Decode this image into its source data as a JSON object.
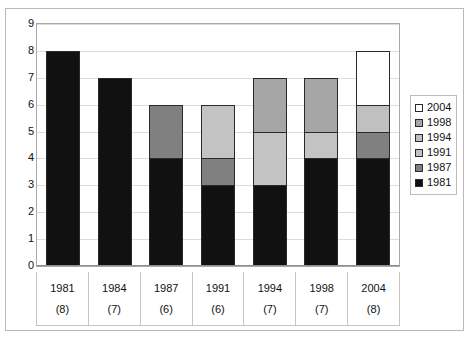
{
  "chart_data": {
    "type": "bar",
    "subtype": "stacked-bar",
    "title": "",
    "xlabel": "",
    "ylabel": "",
    "ylim": [
      0,
      9
    ],
    "ytick_labels": [
      "9",
      "8",
      "7",
      "6",
      "5",
      "4",
      "3",
      "2",
      "1",
      "0"
    ],
    "yticks": [
      9,
      8,
      7,
      6,
      5,
      4,
      3,
      2,
      1,
      0
    ],
    "grid": true,
    "legend_position": "right",
    "categories": [
      "1981",
      "1984",
      "1987",
      "1991",
      "1994",
      "1998",
      "2004"
    ],
    "category_counts": [
      "(8)",
      "(7)",
      "(6)",
      "(6)",
      "(7)",
      "(7)",
      "(8)"
    ],
    "totals": [
      8,
      7,
      6,
      6,
      7,
      7,
      8
    ],
    "series": [
      {
        "name": "1981",
        "color": "#111111",
        "values": [
          8,
          7,
          4,
          3,
          3,
          4,
          4
        ]
      },
      {
        "name": "1987",
        "color": "#808080",
        "values": [
          0,
          0,
          2,
          1,
          0,
          0,
          1
        ]
      },
      {
        "name": "1991",
        "color": "#c3c3c3",
        "values": [
          0,
          0,
          0,
          2,
          2,
          1,
          0
        ]
      },
      {
        "name": "1994",
        "color": "#c0c0c0",
        "values": [
          0,
          0,
          0,
          0,
          0,
          0,
          1
        ]
      },
      {
        "name": "1998",
        "color": "#a6a6a6",
        "values": [
          0,
          0,
          0,
          0,
          2,
          2,
          0
        ]
      },
      {
        "name": "2004",
        "color": "#ffffff",
        "values": [
          0,
          0,
          0,
          0,
          0,
          0,
          2
        ]
      }
    ],
    "legend": [
      {
        "label": "2004",
        "color": "#ffffff"
      },
      {
        "label": "1998",
        "color": "#a6a6a6"
      },
      {
        "label": "1994",
        "color": "#c0c0c0"
      },
      {
        "label": "1991",
        "color": "#c3c3c3"
      },
      {
        "label": "1987",
        "color": "#808080"
      },
      {
        "label": "1981",
        "color": "#111111"
      }
    ],
    "stack_order_bottom_to_top": [
      "1981",
      "1987",
      "1991",
      "1994",
      "1998",
      "2004"
    ]
  }
}
